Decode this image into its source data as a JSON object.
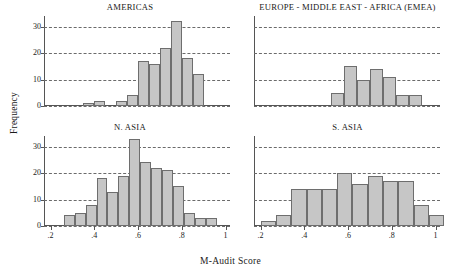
{
  "figure": {
    "ylabel": "Frequency",
    "xlabel": "M-Audit Score"
  },
  "axes": {
    "yticks": [
      "0",
      "10",
      "20",
      "30"
    ],
    "ytick_values": [
      0,
      10,
      20,
      30
    ],
    "ylim": [
      0,
      34
    ],
    "xticks": [
      ".2",
      ".4",
      ".6",
      ".8",
      "1"
    ],
    "xtick_values": [
      0.2,
      0.4,
      0.6,
      0.8,
      1.0
    ],
    "xlim": [
      0.17,
      1.02
    ],
    "grid": "horizontal-dashed"
  },
  "style": {
    "bar_fill": "#c6c6c6",
    "bar_edge": "#6e6e6e",
    "grid_color": "#6b6b6b",
    "axis_color": "#555555",
    "text_color": "#1a1a1a",
    "background": "#ffffff"
  },
  "chart_data": {
    "type": "bar",
    "title": "",
    "xlabel": "M-Audit Score",
    "ylabel": "Frequency",
    "ylim": [
      0,
      34
    ],
    "xlim": [
      0.17,
      1.02
    ],
    "grid": true,
    "legend": "none",
    "panels": [
      {
        "id": "americas",
        "title": "AMERICAS",
        "bin_width": 0.05,
        "bins": [
          {
            "x0": 0.35,
            "x1": 0.4,
            "value": 1
          },
          {
            "x0": 0.4,
            "x1": 0.45,
            "value": 2
          },
          {
            "x0": 0.5,
            "x1": 0.55,
            "value": 2
          },
          {
            "x0": 0.55,
            "x1": 0.6,
            "value": 4
          },
          {
            "x0": 0.6,
            "x1": 0.65,
            "value": 17
          },
          {
            "x0": 0.65,
            "x1": 0.7,
            "value": 16
          },
          {
            "x0": 0.7,
            "x1": 0.75,
            "value": 22
          },
          {
            "x0": 0.75,
            "x1": 0.8,
            "value": 32
          },
          {
            "x0": 0.8,
            "x1": 0.85,
            "value": 18
          },
          {
            "x0": 0.85,
            "x1": 0.9,
            "value": 12
          }
        ]
      },
      {
        "id": "emea",
        "title": "EUROPE - MIDDLE EAST - AFRICA (EMEA)",
        "bin_width": 0.06,
        "bins": [
          {
            "x0": 0.52,
            "x1": 0.58,
            "value": 5
          },
          {
            "x0": 0.58,
            "x1": 0.64,
            "value": 15
          },
          {
            "x0": 0.64,
            "x1": 0.7,
            "value": 10
          },
          {
            "x0": 0.7,
            "x1": 0.76,
            "value": 14
          },
          {
            "x0": 0.76,
            "x1": 0.82,
            "value": 11
          },
          {
            "x0": 0.82,
            "x1": 0.88,
            "value": 4
          },
          {
            "x0": 0.88,
            "x1": 0.94,
            "value": 4
          }
        ]
      },
      {
        "id": "n-asia",
        "title": "N. ASIA",
        "bin_width": 0.05,
        "bins": [
          {
            "x0": 0.26,
            "x1": 0.31,
            "value": 4
          },
          {
            "x0": 0.31,
            "x1": 0.36,
            "value": 5
          },
          {
            "x0": 0.36,
            "x1": 0.41,
            "value": 8
          },
          {
            "x0": 0.41,
            "x1": 0.46,
            "value": 18
          },
          {
            "x0": 0.46,
            "x1": 0.51,
            "value": 13
          },
          {
            "x0": 0.51,
            "x1": 0.56,
            "value": 19
          },
          {
            "x0": 0.56,
            "x1": 0.61,
            "value": 33
          },
          {
            "x0": 0.61,
            "x1": 0.66,
            "value": 24
          },
          {
            "x0": 0.66,
            "x1": 0.71,
            "value": 22
          },
          {
            "x0": 0.71,
            "x1": 0.76,
            "value": 21
          },
          {
            "x0": 0.76,
            "x1": 0.81,
            "value": 15
          },
          {
            "x0": 0.81,
            "x1": 0.86,
            "value": 5
          },
          {
            "x0": 0.86,
            "x1": 0.91,
            "value": 3
          },
          {
            "x0": 0.91,
            "x1": 0.96,
            "value": 3
          }
        ]
      },
      {
        "id": "s-asia",
        "title": "S. ASIA",
        "bin_width": 0.07,
        "bins": [
          {
            "x0": 0.2,
            "x1": 0.27,
            "value": 2
          },
          {
            "x0": 0.27,
            "x1": 0.34,
            "value": 4
          },
          {
            "x0": 0.34,
            "x1": 0.41,
            "value": 14
          },
          {
            "x0": 0.41,
            "x1": 0.48,
            "value": 14
          },
          {
            "x0": 0.48,
            "x1": 0.55,
            "value": 14
          },
          {
            "x0": 0.55,
            "x1": 0.62,
            "value": 20
          },
          {
            "x0": 0.62,
            "x1": 0.69,
            "value": 16
          },
          {
            "x0": 0.69,
            "x1": 0.76,
            "value": 19
          },
          {
            "x0": 0.76,
            "x1": 0.83,
            "value": 17
          },
          {
            "x0": 0.83,
            "x1": 0.9,
            "value": 17
          },
          {
            "x0": 0.9,
            "x1": 0.97,
            "value": 8
          },
          {
            "x0": 0.97,
            "x1": 1.04,
            "value": 4
          }
        ]
      }
    ]
  }
}
